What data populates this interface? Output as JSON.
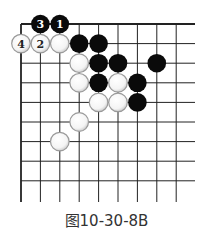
{
  "diagram": {
    "type": "go-board-partial",
    "caption": "图10-30-8B",
    "grid": {
      "origin_x": 21,
      "origin_y": 24,
      "spacing_x": 19.4,
      "spacing_y": 19.6,
      "cols": 9,
      "rows": 9,
      "line_end_x": 195,
      "line_end_y": 202,
      "corner": "top-left",
      "line_color": "#222222"
    },
    "stones": [
      {
        "color": "black",
        "col": 1,
        "row": 0,
        "label": "3"
      },
      {
        "color": "black",
        "col": 2,
        "row": 0,
        "label": "1"
      },
      {
        "color": "white",
        "col": 0,
        "row": 1,
        "label": "4"
      },
      {
        "color": "white",
        "col": 1,
        "row": 1,
        "label": "2"
      },
      {
        "color": "white",
        "col": 2,
        "row": 1,
        "label": ""
      },
      {
        "color": "black",
        "col": 3,
        "row": 1,
        "label": ""
      },
      {
        "color": "black",
        "col": 4,
        "row": 1,
        "label": ""
      },
      {
        "color": "white",
        "col": 3,
        "row": 2,
        "label": ""
      },
      {
        "color": "black",
        "col": 4,
        "row": 2,
        "label": ""
      },
      {
        "color": "black",
        "col": 5,
        "row": 2,
        "label": ""
      },
      {
        "color": "black",
        "col": 7,
        "row": 2,
        "label": ""
      },
      {
        "color": "white",
        "col": 3,
        "row": 3,
        "label": ""
      },
      {
        "color": "black",
        "col": 4,
        "row": 3,
        "label": ""
      },
      {
        "color": "white",
        "col": 5,
        "row": 3,
        "label": ""
      },
      {
        "color": "black",
        "col": 6,
        "row": 3,
        "label": ""
      },
      {
        "color": "white",
        "col": 4,
        "row": 4,
        "label": ""
      },
      {
        "color": "white",
        "col": 5,
        "row": 4,
        "label": ""
      },
      {
        "color": "black",
        "col": 6,
        "row": 4,
        "label": ""
      },
      {
        "color": "white",
        "col": 3,
        "row": 5,
        "label": ""
      },
      {
        "color": "white",
        "col": 2,
        "row": 6,
        "label": ""
      }
    ],
    "colors": {
      "black_stone": "#0a0a0a",
      "white_stone": "#ffffff",
      "white_stone_border": "#9a9a9a",
      "label_on_black": "#ffffff",
      "label_on_white": "#222222"
    }
  }
}
